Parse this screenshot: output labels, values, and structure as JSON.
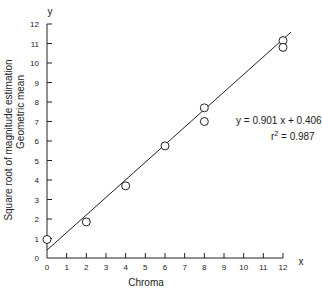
{
  "chart_data": {
    "type": "scatter",
    "title": "",
    "xlabel": "Chroma",
    "ylabel_line1": "Square root of magnitude estimation",
    "ylabel_line2": "Geometric mean",
    "x_axis_letter": "x",
    "y_axis_letter": "y",
    "xlim": [
      0,
      12
    ],
    "ylim": [
      0,
      12
    ],
    "x_ticks": [
      "0",
      "1",
      "2",
      "3",
      "4",
      "5",
      "6",
      "7",
      "8",
      "9",
      "10",
      "11",
      "12"
    ],
    "y_ticks": [
      "0",
      "1",
      "2",
      "3",
      "4",
      "5",
      "6",
      "7",
      "8",
      "9",
      "10",
      "11",
      "12"
    ],
    "grid": false,
    "points": [
      {
        "x": 0,
        "y": 0.95
      },
      {
        "x": 2,
        "y": 1.85
      },
      {
        "x": 4,
        "y": 3.7
      },
      {
        "x": 6,
        "y": 5.75
      },
      {
        "x": 8,
        "y": 7.7
      },
      {
        "x": 8,
        "y": 7.0
      },
      {
        "x": 12,
        "y": 11.15
      },
      {
        "x": 12,
        "y": 10.8
      }
    ],
    "fit_line": {
      "slope": 0.901,
      "intercept": 0.406,
      "x_start": 0,
      "x_end": 12.4
    },
    "annotations": {
      "equation": "y = 0.901 x + 0.406",
      "r2_label": "r",
      "r2_sup": "2",
      "r2_value": " = 0.987"
    }
  }
}
